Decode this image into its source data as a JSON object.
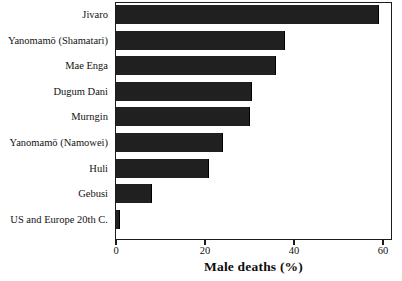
{
  "chart_data": {
    "type": "bar",
    "orientation": "horizontal",
    "title": "",
    "xlabel": "Male deaths (%)",
    "ylabel": "",
    "xlim": [
      0,
      62
    ],
    "xticks": [
      0,
      20,
      40,
      60
    ],
    "xtick_labels": [
      "0",
      "20",
      "40",
      "60"
    ],
    "grid": false,
    "legend": false,
    "bar_color": "#1a1a1a",
    "frame_color": "#1b1b1b",
    "background": "#ffffff",
    "categories": [
      "Jivaro",
      "Yanomamö (Shamatari)",
      "Mae Enga",
      "Dugum Dani",
      "Murngin",
      "Yanomamö (Namowei)",
      "Huli",
      "Gebusi",
      "US and Europe 20th C."
    ],
    "values": [
      59,
      38,
      36,
      30.5,
      30,
      24,
      21,
      8,
      1
    ],
    "points": [
      {
        "category": "Jivaro",
        "value": 59
      },
      {
        "category": "Yanomamö (Shamatari)",
        "value": 38
      },
      {
        "category": "Mae Enga",
        "value": 36
      },
      {
        "category": "Dugum Dani",
        "value": 30.5
      },
      {
        "category": "Murngin",
        "value": 30
      },
      {
        "category": "Yanomamö (Namowei)",
        "value": 24
      },
      {
        "category": "Huli",
        "value": 21
      },
      {
        "category": "Gebusi",
        "value": 8
      },
      {
        "category": "US and Europe 20th C.",
        "value": 1
      }
    ]
  }
}
